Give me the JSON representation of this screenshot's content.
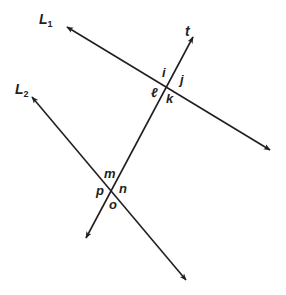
{
  "figure": {
    "type": "parallel-lines-with-transversal",
    "lines": {
      "L1": {
        "name": "L",
        "sub": "1"
      },
      "L2": {
        "name": "L",
        "sub": "2"
      },
      "t": {
        "name": "t"
      }
    },
    "angles_top_intersection": {
      "i": "i",
      "j": "j",
      "l": "ℓ",
      "k": "k"
    },
    "angles_bottom_intersection": {
      "m": "m",
      "n": "n",
      "p": "p",
      "o": "o"
    },
    "colors": {
      "stroke": "#231f20",
      "background": "#ffffff"
    }
  }
}
